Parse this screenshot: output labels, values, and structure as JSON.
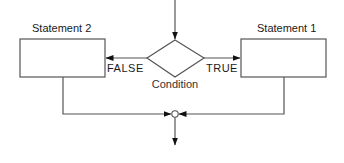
{
  "diagram": {
    "type": "flowchart-if-then-else",
    "colors": {
      "stroke": "#555555",
      "arrowhead": "#111111",
      "text": "#1a1a1a",
      "background": "#ffffff"
    },
    "nodes": {
      "statement_2": {
        "label": "Statement 2",
        "shape": "rectangle"
      },
      "statement_1": {
        "label": "Statement 1",
        "shape": "rectangle"
      },
      "condition": {
        "label": "Condition",
        "shape": "diamond"
      },
      "junction": {
        "shape": "circle"
      }
    },
    "edges": {
      "false_branch": {
        "label": "FALSE",
        "from": "condition",
        "to": "statement_2"
      },
      "true_branch": {
        "label": "TRUE",
        "from": "condition",
        "to": "statement_1"
      },
      "entry": {
        "to": "condition"
      },
      "merge_left": {
        "from": "statement_2",
        "to": "junction"
      },
      "merge_right": {
        "from": "statement_1",
        "to": "junction"
      },
      "exit": {
        "from": "junction"
      }
    }
  }
}
